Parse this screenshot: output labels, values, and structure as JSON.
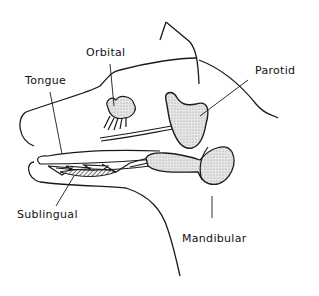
{
  "diagram": {
    "labels": {
      "orbital": "Orbital",
      "parotid": "Parotid",
      "tongue": "Tongue",
      "sublingual": "Sublingual",
      "mandibular": "Mandibular"
    },
    "colors": {
      "line": "#1a1a1a",
      "gland_fill": "#d9d9d9",
      "background": "#ffffff"
    }
  }
}
